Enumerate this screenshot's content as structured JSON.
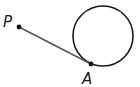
{
  "diagram": {
    "type": "geometry-tangent",
    "circle": {
      "cx": 103,
      "cy": 36,
      "r": 30,
      "stroke": "#1a1a1a"
    },
    "segment": {
      "from": "P",
      "to": "A",
      "stroke": "#555555"
    },
    "points": [
      {
        "id": "P",
        "label": "P",
        "x": 19,
        "y": 27,
        "label_x": 3,
        "label_y": 27
      },
      {
        "id": "A",
        "label": "A",
        "x": 91,
        "y": 64,
        "label_x": 82,
        "label_y": 84
      }
    ]
  }
}
